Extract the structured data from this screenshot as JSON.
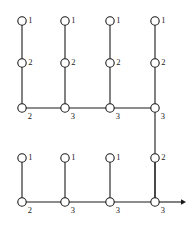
{
  "diagram": {
    "canvas": {
      "width": 194,
      "height": 229
    },
    "style": {
      "line_color": "#1a1a1a",
      "node_fill": "#ffffff",
      "node_stroke": "#1a1a1a",
      "background": "#ffffff",
      "node_radius": 4.2,
      "line_width": 1.1
    },
    "columns_x": [
      22,
      65,
      110,
      155
    ],
    "rows_y": {
      "top_tip": 21,
      "top_mid": 63,
      "top_base": 108,
      "bottom_tip": 158,
      "bottom_base": 202
    },
    "sections": [
      {
        "name": "upper-tree",
        "baseline_y": 108,
        "baseline_x_start": 22,
        "baseline_x_end": 155,
        "branches": [
          {
            "column": 0,
            "x": 22,
            "nodes": [
              {
                "id": "u0-tip",
                "y": 21,
                "label": "1",
                "label_pos": "right"
              },
              {
                "id": "u0-mid",
                "y": 63,
                "label": "2",
                "label_pos": "right"
              },
              {
                "id": "u0-base",
                "y": 108,
                "label": "2",
                "label_pos": "below-right"
              }
            ]
          },
          {
            "column": 1,
            "x": 65,
            "nodes": [
              {
                "id": "u1-tip",
                "y": 21,
                "label": "1",
                "label_pos": "right"
              },
              {
                "id": "u1-mid",
                "y": 63,
                "label": "2",
                "label_pos": "right"
              },
              {
                "id": "u1-base",
                "y": 108,
                "label": "3",
                "label_pos": "below-right"
              }
            ]
          },
          {
            "column": 2,
            "x": 110,
            "nodes": [
              {
                "id": "u2-tip",
                "y": 21,
                "label": "1",
                "label_pos": "right"
              },
              {
                "id": "u2-mid",
                "y": 63,
                "label": "2",
                "label_pos": "right"
              },
              {
                "id": "u2-base",
                "y": 108,
                "label": "3",
                "label_pos": "below-right"
              }
            ]
          },
          {
            "column": 3,
            "x": 155,
            "nodes": [
              {
                "id": "u3-tip",
                "y": 21,
                "label": "1",
                "label_pos": "right"
              },
              {
                "id": "u3-mid",
                "y": 63,
                "label": "2",
                "label_pos": "right"
              },
              {
                "id": "u3-base",
                "y": 108,
                "label": "3",
                "label_pos": "below-right"
              }
            ]
          }
        ]
      },
      {
        "name": "lower-tree",
        "baseline_y": 202,
        "baseline_x_start": 22,
        "baseline_x_end": 155,
        "branches": [
          {
            "column": 0,
            "x": 22,
            "nodes": [
              {
                "id": "l0-tip",
                "y": 158,
                "label": "1",
                "label_pos": "right"
              },
              {
                "id": "l0-base",
                "y": 202,
                "label": "2",
                "label_pos": "below-right"
              }
            ]
          },
          {
            "column": 1,
            "x": 65,
            "nodes": [
              {
                "id": "l1-tip",
                "y": 158,
                "label": "1",
                "label_pos": "right"
              },
              {
                "id": "l1-base",
                "y": 202,
                "label": "3",
                "label_pos": "below-right"
              }
            ]
          },
          {
            "column": 2,
            "x": 110,
            "nodes": [
              {
                "id": "l2-tip",
                "y": 158,
                "label": "1",
                "label_pos": "right"
              },
              {
                "id": "l2-base",
                "y": 202,
                "label": "3",
                "label_pos": "below-right"
              }
            ]
          },
          {
            "column": 3,
            "x": 155,
            "nodes": [
              {
                "id": "l3-mid",
                "y": 158,
                "label": "2",
                "label_pos": "right"
              },
              {
                "id": "l3-base",
                "y": 202,
                "label": "3",
                "label_pos": "below-right"
              }
            ]
          }
        ]
      }
    ],
    "connector": {
      "name": "inter-section-connector",
      "x": 155,
      "y_start": 108,
      "y_end": 202,
      "description": "vertical line joining upper baseline right end to lower baseline right end through node labelled 2"
    },
    "arrow": {
      "name": "continuation-arrow",
      "y": 202,
      "x_start": 155,
      "x_end": 186,
      "head_size": 5,
      "direction": "right"
    },
    "labels_summary": {
      "upper_tips": [
        "1",
        "1",
        "1",
        "1"
      ],
      "upper_mids": [
        "2",
        "2",
        "2",
        "2"
      ],
      "upper_bases": [
        "2",
        "3",
        "3",
        "3"
      ],
      "lower_tips": [
        "1",
        "1",
        "1",
        "2"
      ],
      "lower_bases": [
        "2",
        "3",
        "3",
        "3"
      ]
    }
  }
}
